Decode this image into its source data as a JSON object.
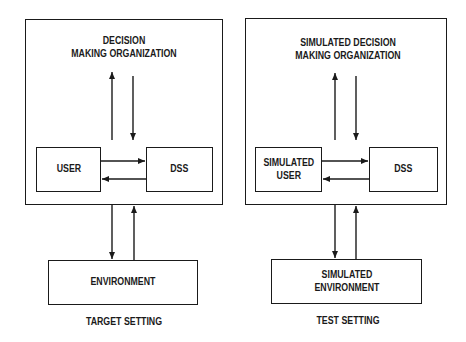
{
  "diagram": {
    "panels": [
      {
        "caption": "TARGET SETTING",
        "organization_label_line1": "DECISION",
        "organization_label_line2": "MAKING ORGANIZATION",
        "user_label": "USER",
        "dss_label": "DSS",
        "environment_label": "ENVIRONMENT"
      },
      {
        "caption": "TEST SETTING",
        "organization_label_line1": "SIMULATED DECISION",
        "organization_label_line2": "MAKING ORGANIZATION",
        "user_label": "SIMULATED\nUSER",
        "dss_label": "DSS",
        "environment_label": "SIMULATED\nENVIRONMENT"
      }
    ],
    "edges": [
      {
        "from": "user",
        "to": "dss"
      },
      {
        "from": "dss",
        "to": "user"
      },
      {
        "from": "user-dss-pair",
        "to": "organization"
      },
      {
        "from": "organization",
        "to": "user-dss-pair"
      },
      {
        "from": "organization-box",
        "to": "environment"
      },
      {
        "from": "environment",
        "to": "organization-box"
      }
    ],
    "colors": {
      "stroke": "#1a1a1a",
      "background": "#ffffff"
    }
  }
}
